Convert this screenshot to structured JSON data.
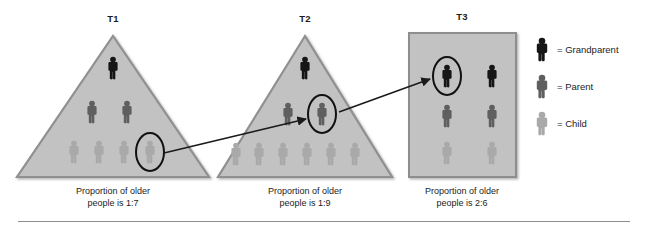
{
  "figure": {
    "title_bar": "",
    "divider_visible": true,
    "background_color": "#ffffff"
  },
  "colors": {
    "grandparent": "#161616",
    "parent": "#5f5f5f",
    "child": "#a9a9a9",
    "panel_fill": "#c2c2c2",
    "panel_stroke": "#8e8e8e",
    "arrow": "#1a1a1a",
    "highlight_ring": "#111111",
    "text": "#1c1c1c",
    "divider": "#8d8d91"
  },
  "panels": [
    {
      "id": "t1",
      "label": "T1",
      "shape": "triangle",
      "caption": "Proportion of older\npeople is 1:7",
      "counts": {
        "grandparent": 1,
        "parent": 2,
        "child": 4
      },
      "ratio": "1:7",
      "rows": [
        {
          "role": "grandparent",
          "count": 1
        },
        {
          "role": "parent",
          "count": 2
        },
        {
          "role": "child",
          "count": 4
        }
      ],
      "highlighted": {
        "role": "child",
        "index": 3
      }
    },
    {
      "id": "t2",
      "label": "T2",
      "shape": "triangle",
      "caption": "Proportion of older\npeople is 1:9",
      "counts": {
        "grandparent": 1,
        "parent": 2,
        "child": 6
      },
      "ratio": "1:9",
      "rows": [
        {
          "role": "grandparent",
          "count": 1
        },
        {
          "role": "parent",
          "count": 2
        },
        {
          "role": "child",
          "count": 6
        }
      ],
      "highlighted": {
        "role": "parent",
        "index": 1
      }
    },
    {
      "id": "t3",
      "label": "T3",
      "shape": "rectangle",
      "caption": "Proportion of older\npeople is 2:6",
      "counts": {
        "grandparent": 2,
        "parent": 2,
        "child": 2
      },
      "ratio": "2:6",
      "rows": [
        {
          "role": "grandparent",
          "count": 2
        },
        {
          "role": "parent",
          "count": 2
        },
        {
          "role": "child",
          "count": 2
        }
      ],
      "highlighted": {
        "role": "grandparent",
        "index": 0
      }
    }
  ],
  "arrows": [
    {
      "id": "arrow-t1-to-t2",
      "from_panel": "t1",
      "to_panel": "t2",
      "from_role": "child",
      "to_role": "parent"
    },
    {
      "id": "arrow-t2-to-t3",
      "from_panel": "t2",
      "to_panel": "t3",
      "from_role": "parent",
      "to_role": "grandparent"
    }
  ],
  "legend": {
    "items": [
      {
        "role": "grandparent",
        "separator": "=",
        "label": "Grandparent"
      },
      {
        "role": "parent",
        "separator": "=",
        "label": "Parent"
      },
      {
        "role": "child",
        "separator": "=",
        "label": "Child"
      }
    ]
  }
}
